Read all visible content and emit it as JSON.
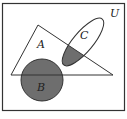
{
  "diagram": {
    "type": "venn",
    "universe_label": "U",
    "sets": [
      {
        "name": "A",
        "shape": "triangle",
        "label": "A"
      },
      {
        "name": "B",
        "shape": "circle",
        "label": "B"
      },
      {
        "name": "C",
        "shape": "ellipse",
        "label": "C"
      }
    ],
    "shaded_regions": [
      "B",
      "A ∩ C"
    ],
    "colors": {
      "stroke": "#333333",
      "shade": "#6e6e6e",
      "background": "#ffffff"
    }
  }
}
